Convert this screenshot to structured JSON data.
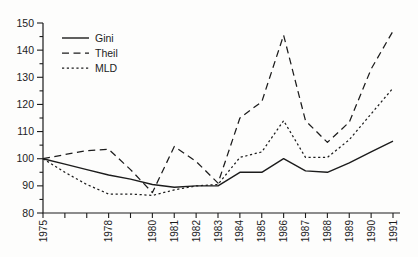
{
  "figure": {
    "kind": "scanned-book-line-chart",
    "background": "#fdfdfc",
    "line_color": "#1c1c1c"
  },
  "chart_data": {
    "type": "line",
    "title": "",
    "xlabel": "",
    "ylabel": "",
    "x": [
      1975,
      1976,
      1977,
      1978,
      1979,
      1980,
      1981,
      1982,
      1983,
      1984,
      1985,
      1986,
      1987,
      1988,
      1989,
      1990,
      1991
    ],
    "x_labeled_ticks": [
      1975,
      1978,
      1980,
      1981,
      1982,
      1983,
      1984,
      1985,
      1986,
      1987,
      1988,
      1989,
      1990,
      1991
    ],
    "ylim": [
      80,
      150
    ],
    "y_major_step": 10,
    "y_minor_step": 5,
    "grid": false,
    "legend_position": "upper-left",
    "series": [
      {
        "name": "Gini",
        "style": "solid",
        "values": [
          100,
          98,
          96,
          94,
          92.5,
          90.5,
          89.5,
          90,
          90,
          95,
          95,
          100,
          95.5,
          95,
          98.5,
          102.5,
          106.5
        ]
      },
      {
        "name": "Theil",
        "style": "dashed",
        "values": [
          100,
          101.5,
          103,
          103.5,
          96,
          87.5,
          104.5,
          99,
          91,
          115,
          121,
          145.5,
          114,
          106,
          113.5,
          133,
          147
        ]
      },
      {
        "name": "MLD",
        "style": "dotted",
        "values": [
          100,
          95,
          90.5,
          87,
          87,
          86.5,
          88.5,
          90,
          90.5,
          100.5,
          102.5,
          114,
          100.5,
          100.5,
          107,
          116.5,
          126
        ]
      }
    ]
  }
}
